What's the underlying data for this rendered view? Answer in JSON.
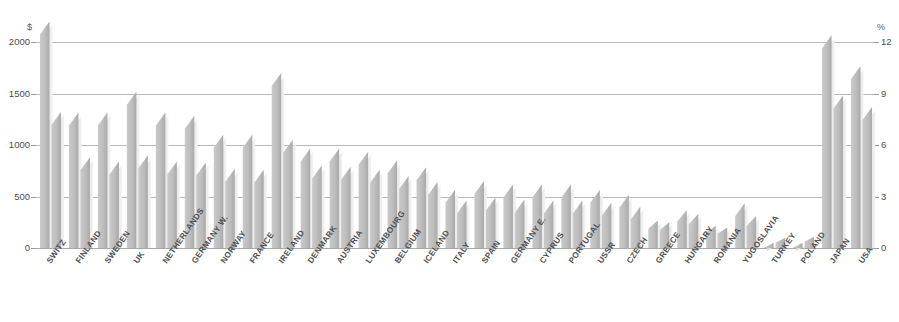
{
  "chart_data": {
    "type": "bar",
    "title": "",
    "xlabel": "",
    "ylabel": "$",
    "y2label": "%",
    "ylim": [
      0,
      2400
    ],
    "y2lim": [
      0,
      14.4
    ],
    "yticks": [
      "0",
      "500",
      "1000",
      "1500",
      "2000"
    ],
    "ytick_values": [
      0,
      500,
      1000,
      1500,
      2000
    ],
    "y2ticks": [
      "0",
      "3",
      "6",
      "9",
      "12"
    ],
    "y2tick_values": [
      0,
      3,
      6,
      9,
      12
    ],
    "grid": true,
    "legend": "none",
    "categories": [
      "SWITZ",
      "FINLAND",
      "SWEDEN",
      "UK",
      "NETHERLANDS",
      "GERMANY W.",
      "NORWAY",
      "FRANCE",
      "IRELAND",
      "DENMARK",
      "AUSTRIA",
      "LUXEMBOURG",
      "BELGIUM",
      "ICELAND",
      "ITALY",
      "SPAIN",
      "GERMANY E.",
      "CYPRUS",
      "PORTUGAL",
      "USSR",
      "CZECH",
      "GREECE",
      "HUNGARY",
      "ROMANIA",
      "YUGOSLAVIA",
      "TURKEY",
      "POLAND",
      "JAPAN",
      "USA"
    ],
    "series": [
      {
        "name": "percent-of-gdp",
        "axis": "right",
        "unit": "%",
        "values": [
          13.2,
          7.9,
          7.9,
          9.1,
          7.9,
          7.7,
          6.6,
          6.6,
          10.2,
          5.8,
          5.8,
          5.6,
          5.1,
          4.7,
          3.4,
          3.9,
          3.7,
          3.7,
          3.7,
          3.4,
          3.1,
          1.6,
          2.2,
          1.3,
          2.6,
          0.3,
          0.3,
          12.4,
          10.6
        ]
      },
      {
        "name": "dollars-per-capita",
        "axis": "left",
        "unit": "$",
        "values": [
          1320,
          880,
          840,
          900,
          840,
          830,
          770,
          760,
          1050,
          800,
          790,
          760,
          700,
          640,
          460,
          490,
          470,
          460,
          460,
          440,
          400,
          250,
          330,
          200,
          310,
          100,
          110,
          1480,
          1370
        ]
      }
    ]
  }
}
